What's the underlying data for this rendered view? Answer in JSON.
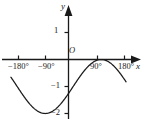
{
  "figure": {
    "title": "",
    "background_color": "#ffffff",
    "stroke_color": "#1a1a1a"
  },
  "axes": {
    "x_axis_name": "x",
    "y_axis_name": "y",
    "origin_label": "O"
  },
  "chart_data": {
    "type": "line",
    "title": "",
    "xlabel": "x",
    "ylabel": "y",
    "grid": false,
    "legend": null,
    "xlim": [
      -210,
      200
    ],
    "ylim": [
      -2.45,
      1.55
    ],
    "xticks": [
      -180,
      -90,
      90,
      180
    ],
    "xtick_labels": [
      "−180°",
      "−90°",
      "90°",
      "180°"
    ],
    "yticks": [
      1,
      -1,
      -2
    ],
    "ytick_labels": [
      "1",
      "−1",
      "−2"
    ],
    "annotations": [
      {
        "text": "peak",
        "x": -75,
        "y": 0.0
      },
      {
        "text": "minimum",
        "x": 105,
        "y": -2.0
      },
      {
        "text": "y-intercept",
        "x": 0,
        "y": -1.0
      }
    ],
    "series": [
      {
        "name": "curve",
        "comment": "sinusoid y = sin(x - 15deg) - 1 drawn from -185deg to 185deg",
        "x": [
          -185,
          -170,
          -155,
          -140,
          -125,
          -110,
          -95,
          -80,
          -65,
          -50,
          -35,
          -20,
          -5,
          10,
          25,
          40,
          55,
          70,
          85,
          100,
          115,
          130,
          145,
          160,
          175,
          185
        ],
        "y": [
          -1.97,
          -1.91,
          -1.79,
          -1.62,
          -1.42,
          -1.19,
          -0.97,
          -0.75,
          -0.57,
          -0.42,
          -0.32,
          -0.26,
          -0.26,
          -0.32,
          -0.42,
          -0.57,
          -0.75,
          -0.97,
          -1.19,
          -1.42,
          -1.62,
          -1.79,
          -1.91,
          -1.98,
          -1.99,
          -1.96
        ]
      }
    ]
  }
}
